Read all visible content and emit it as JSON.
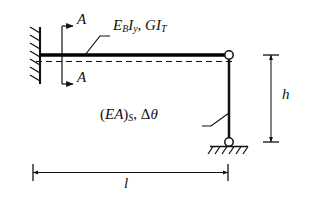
{
  "diagram": {
    "type": "structural-frame",
    "colors": {
      "ink": "#111111",
      "beam": "#000000",
      "background": "#ffffff"
    },
    "labels": {
      "section_a_top": "A",
      "section_a_bottom": "A",
      "beam_properties": "E",
      "beam_properties_sub1": "B",
      "beam_properties_mid": "I",
      "beam_properties_sub2": "y",
      "beam_properties_comma": ", ",
      "beam_properties_tail": "GI",
      "beam_properties_sub3": "T",
      "strut_properties_open": "(",
      "strut_properties_ea": "EA",
      "strut_properties_close": ")",
      "strut_properties_sub": "S",
      "strut_properties_comma": ", ",
      "strut_properties_delta": "Δ",
      "strut_properties_theta": "θ",
      "height_dim": "h",
      "length_dim": "l"
    },
    "elements": {
      "wall_support": "fixed-wall-hatched",
      "beam": "horizontal-beam",
      "centerline": "dashed-centerline",
      "pin_joint": "hinge-circle",
      "column": "vertical-strut",
      "base_support": "pinned-support-hatched",
      "height_dimension": "vertical-dimension-line",
      "length_dimension": "horizontal-dimension-line",
      "section_cut": "section-cut-a-a"
    },
    "geometry": {
      "beam_left_x": 40,
      "beam_right_x": 228,
      "beam_y": 55,
      "column_bottom_y": 140,
      "span_label": "l",
      "height_label": "h"
    }
  }
}
